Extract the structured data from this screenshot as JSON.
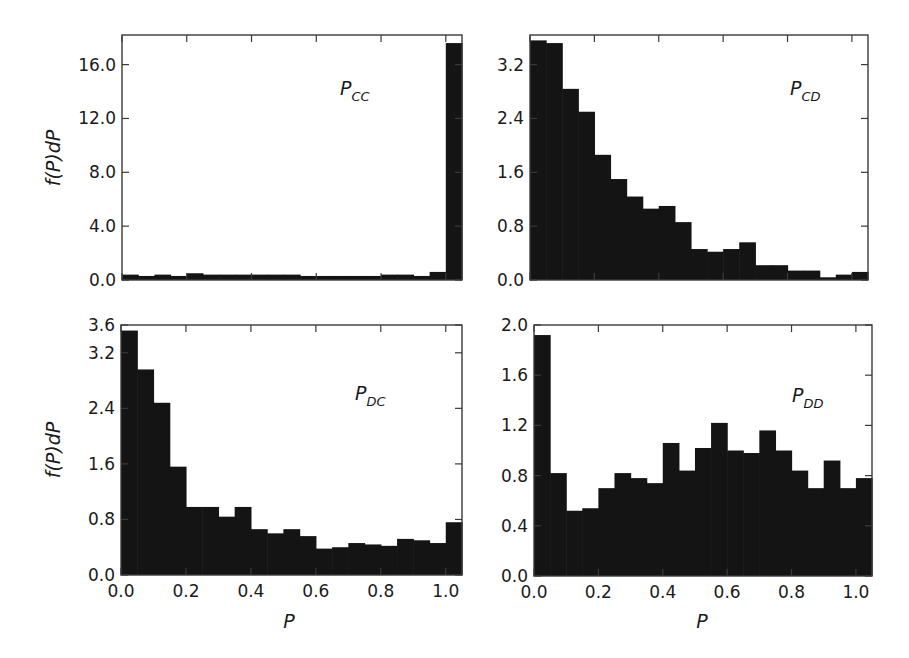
{
  "chart_data": [
    {
      "type": "bar",
      "title": "P_CC",
      "panel_label": {
        "main": "P",
        "sub": "CC"
      },
      "xlabel": "",
      "ylabel": "f(P)dP",
      "bin_width": 0.05,
      "bin_starts": [
        0.0,
        0.05,
        0.1,
        0.15,
        0.2,
        0.25,
        0.3,
        0.35,
        0.4,
        0.45,
        0.5,
        0.55,
        0.6,
        0.65,
        0.7,
        0.75,
        0.8,
        0.85,
        0.9,
        0.95,
        1.0
      ],
      "values": [
        0.4,
        0.3,
        0.4,
        0.3,
        0.5,
        0.4,
        0.4,
        0.4,
        0.4,
        0.4,
        0.4,
        0.3,
        0.3,
        0.3,
        0.3,
        0.3,
        0.4,
        0.4,
        0.3,
        0.6,
        17.6
      ],
      "xlim": [
        0.0,
        1.05
      ],
      "ylim": [
        0.0,
        18.2
      ],
      "yticks": [
        0.0,
        4.0,
        8.0,
        12.0,
        16.0
      ],
      "ytick_labels": [
        "0.0",
        "4.0",
        "8.0",
        "12.0",
        "16.0"
      ],
      "xticks": [
        0.0,
        0.2,
        0.4,
        0.6,
        0.8,
        1.0
      ],
      "xtick_labels": [],
      "grid": false
    },
    {
      "type": "bar",
      "title": "P_CD",
      "panel_label": {
        "main": "P",
        "sub": "CD"
      },
      "xlabel": "",
      "ylabel": "",
      "bin_width": 0.05,
      "bin_starts": [
        0.0,
        0.05,
        0.1,
        0.15,
        0.2,
        0.25,
        0.3,
        0.35,
        0.4,
        0.45,
        0.5,
        0.55,
        0.6,
        0.65,
        0.7,
        0.75,
        0.8,
        0.85,
        0.9,
        0.95,
        1.0
      ],
      "values": [
        3.56,
        3.52,
        2.84,
        2.5,
        1.86,
        1.5,
        1.24,
        1.06,
        1.1,
        0.86,
        0.46,
        0.42,
        0.46,
        0.56,
        0.22,
        0.22,
        0.14,
        0.14,
        0.04,
        0.08,
        0.12
      ],
      "xlim": [
        0.0,
        1.05
      ],
      "ylim": [
        0.0,
        3.64
      ],
      "yticks": [
        0.0,
        0.8,
        1.6,
        2.4,
        3.2
      ],
      "ytick_labels": [
        "0.0",
        "0.8",
        "1.6",
        "2.4",
        "3.2"
      ],
      "xticks": [
        0.0,
        0.2,
        0.4,
        0.6,
        0.8,
        1.0
      ],
      "xtick_labels": [],
      "grid": false
    },
    {
      "type": "bar",
      "title": "P_DC",
      "panel_label": {
        "main": "P",
        "sub": "DC"
      },
      "xlabel": "P",
      "ylabel": "f(P)dP",
      "bin_width": 0.05,
      "bin_starts": [
        0.0,
        0.05,
        0.1,
        0.15,
        0.2,
        0.25,
        0.3,
        0.35,
        0.4,
        0.45,
        0.5,
        0.55,
        0.6,
        0.65,
        0.7,
        0.75,
        0.8,
        0.85,
        0.9,
        0.95,
        1.0
      ],
      "values": [
        3.52,
        2.96,
        2.48,
        1.56,
        0.98,
        0.98,
        0.84,
        0.98,
        0.66,
        0.6,
        0.66,
        0.56,
        0.38,
        0.4,
        0.46,
        0.44,
        0.42,
        0.52,
        0.5,
        0.46,
        0.76
      ],
      "xlim": [
        0.0,
        1.05
      ],
      "ylim": [
        0.0,
        3.6
      ],
      "yticks": [
        0.0,
        0.8,
        1.6,
        2.4,
        3.2,
        3.6
      ],
      "ytick_labels": [
        "0.0",
        "0.8",
        "1.6",
        "2.4",
        "3.2",
        "3.6"
      ],
      "xticks": [
        0.0,
        0.2,
        0.4,
        0.6,
        0.8,
        1.0
      ],
      "xtick_labels": [
        "0.0",
        "0.2",
        "0.4",
        "0.6",
        "0.8",
        "1.0"
      ],
      "grid": false
    },
    {
      "type": "bar",
      "title": "P_DD",
      "panel_label": {
        "main": "P",
        "sub": "DD"
      },
      "xlabel": "P",
      "ylabel": "",
      "bin_width": 0.05,
      "bin_starts": [
        0.0,
        0.05,
        0.1,
        0.15,
        0.2,
        0.25,
        0.3,
        0.35,
        0.4,
        0.45,
        0.5,
        0.55,
        0.6,
        0.65,
        0.7,
        0.75,
        0.8,
        0.85,
        0.9,
        0.95,
        1.0
      ],
      "values": [
        1.92,
        0.82,
        0.52,
        0.54,
        0.7,
        0.82,
        0.78,
        0.74,
        1.06,
        0.84,
        1.02,
        1.22,
        1.0,
        0.98,
        1.16,
        1.0,
        0.84,
        0.7,
        0.92,
        0.7,
        0.78
      ],
      "xlim": [
        0.0,
        1.05
      ],
      "ylim": [
        0.0,
        2.0
      ],
      "yticks": [
        0.0,
        0.4,
        0.8,
        1.2,
        1.6,
        2.0
      ],
      "ytick_labels": [
        "0.0",
        "0.4",
        "0.8",
        "1.2",
        "1.6",
        "2.0"
      ],
      "xticks": [
        0.0,
        0.2,
        0.4,
        0.6,
        0.8,
        1.0
      ],
      "xtick_labels": [
        "0.0",
        "0.2",
        "0.4",
        "0.6",
        "0.8",
        "1.0"
      ],
      "grid": false
    }
  ],
  "labels": {
    "ylabel_top": "f(P)dP",
    "ylabel_bottom": "f(P)dP",
    "xlabel_left": "P",
    "xlabel_right": "P"
  },
  "colors": {
    "bar": "#141414",
    "axis": "#3a3a3a",
    "background": "#ffffff"
  }
}
